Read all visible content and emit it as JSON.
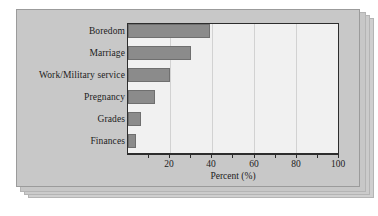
{
  "chart_data": {
    "type": "bar",
    "orientation": "horizontal",
    "title": "",
    "xlabel": "Percent (%)",
    "ylabel": "",
    "categories": [
      "Boredom",
      "Marriage",
      "Work/Military service",
      "Pregnancy",
      "Grades",
      "Finances"
    ],
    "values": [
      39,
      30,
      20,
      13,
      6,
      4
    ],
    "xlim": [
      0,
      100
    ],
    "xticks": [
      20,
      40,
      60,
      80,
      100
    ],
    "xtick_labels": [
      "20",
      "40",
      "60",
      "80",
      "100"
    ],
    "grid": "vertical",
    "legend": "none",
    "bar_color": "#8b8b8b",
    "plot_background": "#f1f1f1",
    "panel_background": "#c8c8c8",
    "axis_color": "#2d2d2d"
  }
}
